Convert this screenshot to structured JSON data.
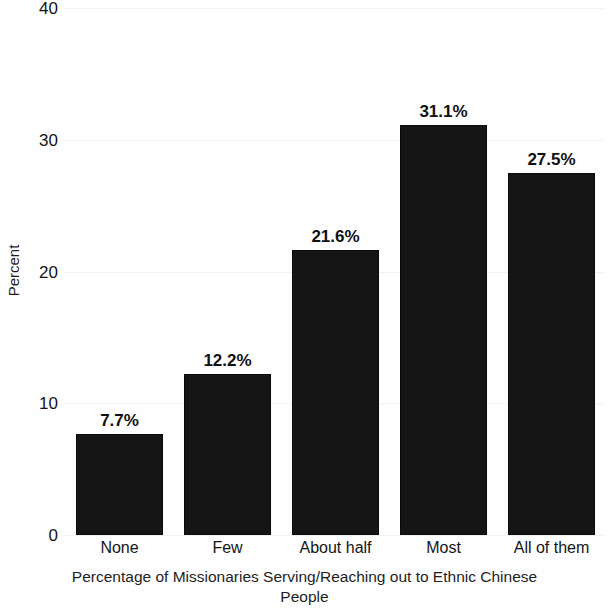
{
  "chart_data": {
    "type": "bar",
    "title": "",
    "subtitle": "",
    "xlabel": "Percentage of Missionaries Serving/Reaching out to Ethnic Chinese People",
    "ylabel": "Percent",
    "categories": [
      "None",
      "Few",
      "About half",
      "Most",
      "All of them"
    ],
    "values": [
      7.7,
      12.2,
      21.6,
      31.1,
      27.5
    ],
    "data_labels": [
      "7.7%",
      "12.2%",
      "21.6%",
      "31.1%",
      "27.5%"
    ],
    "ylim": [
      0,
      40
    ],
    "ytick_labels": [
      "0",
      "10",
      "20",
      "30",
      "40"
    ],
    "ytick_values": [
      0,
      10,
      20,
      30,
      40
    ],
    "grid": true,
    "legend": false,
    "bar_color": "#151515",
    "background_color": "#ffffff"
  },
  "axis": {
    "y_title": "Percent",
    "x_title_line1": "Percentage of Missionaries Serving/Reaching out to Ethnic Chinese",
    "x_title_line2": "People"
  }
}
